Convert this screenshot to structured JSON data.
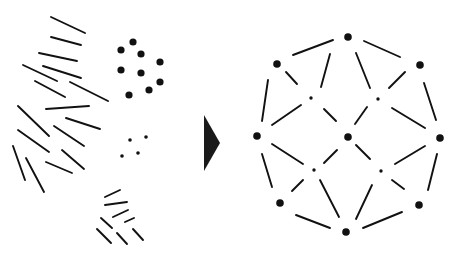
{
  "figure": {
    "stroke_color": "#111111",
    "background": "#ffffff",
    "caption_text": ""
  },
  "left_panel": {
    "name": "disordered-elements",
    "line_segments": [
      [
        51,
        17,
        85,
        33
      ],
      [
        51,
        37,
        81,
        45
      ],
      [
        39,
        53,
        77,
        61
      ],
      [
        23,
        65,
        57,
        81
      ],
      [
        43,
        66,
        81,
        78
      ],
      [
        35,
        81,
        65,
        97
      ],
      [
        70,
        82,
        108,
        101
      ],
      [
        46,
        109,
        89,
        106
      ],
      [
        18,
        106,
        49,
        136
      ],
      [
        66,
        118,
        100,
        129
      ],
      [
        18,
        130,
        49,
        152
      ],
      [
        54,
        126,
        84,
        146
      ],
      [
        13,
        146,
        25,
        180
      ],
      [
        26,
        158,
        44,
        192
      ],
      [
        46,
        162,
        72,
        173
      ],
      [
        62,
        150,
        84,
        169
      ],
      [
        105,
        197,
        120,
        190
      ],
      [
        105,
        205,
        127,
        202
      ],
      [
        113,
        217,
        128,
        210
      ],
      [
        125,
        222,
        134,
        218
      ],
      [
        101,
        218,
        112,
        228
      ],
      [
        97,
        229,
        111,
        243
      ],
      [
        117,
        233,
        127,
        244
      ],
      [
        133,
        229,
        143,
        240
      ]
    ],
    "large_dots": [
      [
        133,
        42
      ],
      [
        121,
        50
      ],
      [
        141,
        54
      ],
      [
        160,
        62
      ],
      [
        121,
        70
      ],
      [
        141,
        73
      ],
      [
        160,
        82
      ],
      [
        129,
        95
      ],
      [
        149,
        90
      ]
    ],
    "small_dots": [
      [
        130,
        140
      ],
      [
        146,
        137
      ],
      [
        122,
        156
      ],
      [
        138,
        153
      ]
    ],
    "bracket_dashes": [
      [
        105,
        205,
        120,
        191
      ]
    ]
  },
  "arrow": {
    "name": "transform-arrow",
    "points": "204,115 220,143 204,171",
    "fill": "#1a1a1a"
  },
  "right_panel": {
    "name": "network-graph",
    "large_nodes": [
      {
        "id": "top",
        "x": 348,
        "y": 37
      },
      {
        "id": "upper-left",
        "x": 277,
        "y": 64
      },
      {
        "id": "upper-right",
        "x": 420,
        "y": 65
      },
      {
        "id": "left",
        "x": 257,
        "y": 136
      },
      {
        "id": "center",
        "x": 348,
        "y": 137
      },
      {
        "id": "right",
        "x": 440,
        "y": 138
      },
      {
        "id": "lower-left",
        "x": 280,
        "y": 203
      },
      {
        "id": "lower-right",
        "x": 419,
        "y": 205
      },
      {
        "id": "bottom",
        "x": 346,
        "y": 232
      }
    ],
    "small_nodes": [
      {
        "id": "inner-ul",
        "x": 311,
        "y": 98
      },
      {
        "id": "inner-ur",
        "x": 378,
        "y": 99
      },
      {
        "id": "inner-ll",
        "x": 314,
        "y": 170
      },
      {
        "id": "inner-lr",
        "x": 381,
        "y": 171
      }
    ],
    "edges": [
      [
        293,
        55,
        333,
        40
      ],
      [
        364,
        41,
        400,
        57
      ],
      [
        268,
        80,
        262,
        121
      ],
      [
        424,
        83,
        436,
        120
      ],
      [
        262,
        154,
        272,
        187
      ],
      [
        437,
        154,
        428,
        190
      ],
      [
        296,
        215,
        330,
        228
      ],
      [
        363,
        228,
        402,
        212
      ],
      [
        286,
        72,
        297,
        84
      ],
      [
        405,
        72,
        389,
        88
      ],
      [
        330,
        54,
        321,
        87
      ],
      [
        356,
        53,
        370,
        88
      ],
      [
        301,
        105,
        272,
        125
      ],
      [
        392,
        108,
        425,
        128
      ],
      [
        324,
        109,
        336,
        121
      ],
      [
        367,
        107,
        355,
        124
      ],
      [
        272,
        144,
        303,
        164
      ],
      [
        425,
        146,
        395,
        164
      ],
      [
        324,
        163,
        337,
        150
      ],
      [
        356,
        145,
        370,
        159
      ],
      [
        292,
        191,
        303,
        180
      ],
      [
        404,
        189,
        392,
        180
      ],
      [
        320,
        180,
        339,
        217
      ],
      [
        372,
        185,
        356,
        219
      ]
    ]
  }
}
